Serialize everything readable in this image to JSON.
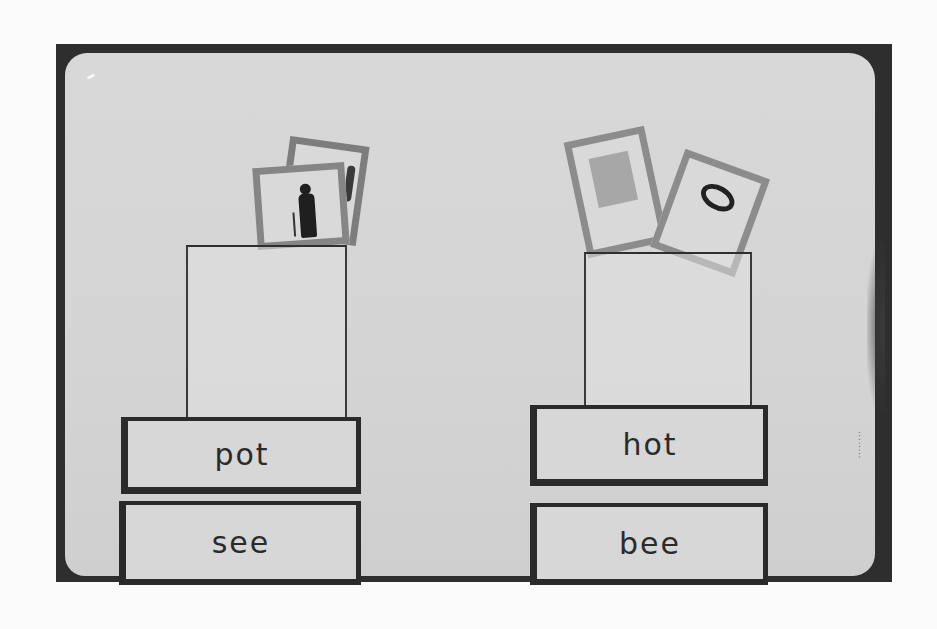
{
  "photo": {
    "description": "Black-and-white photograph of a rhyming-word pocket board",
    "colors": {
      "frame": "#2e2e2e",
      "board": "#d6d6d6",
      "card_border": "#2a2a2a",
      "background": "#fbfbfb"
    }
  },
  "left_group": {
    "pocket_pictures": [
      "person-with-cane-picture",
      "figure-picture"
    ],
    "word_cards": [
      "pot",
      "see"
    ]
  },
  "right_group": {
    "pocket_pictures": [
      "door-picture",
      "letter-a-picture"
    ],
    "word_cards": [
      "hot",
      "bee"
    ]
  },
  "edge_stamp": "········"
}
